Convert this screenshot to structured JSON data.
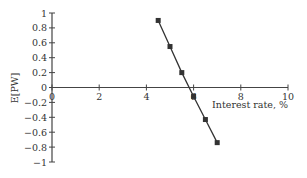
{
  "chart_data": {
    "type": "line",
    "title": "",
    "xlabel": "Interest rate, %",
    "ylabel": "E[PW]",
    "xlim": [
      0,
      10
    ],
    "ylim": [
      -1,
      1
    ],
    "x_ticks": [
      0,
      2,
      4,
      6,
      8,
      10
    ],
    "y_ticks": [
      1,
      0.8,
      0.6,
      0.4,
      0.2,
      0,
      -0.2,
      -0.4,
      -0.6,
      -0.8,
      -1
    ],
    "x_tick_labels": [
      "0",
      "2",
      "4",
      "6",
      "8",
      "10"
    ],
    "y_tick_labels": [
      "1",
      "0.8",
      "0.6",
      "0.4",
      "0.2",
      "0",
      "−0.2",
      "−0.4",
      "−0.6",
      "−0.8",
      "−1"
    ],
    "grid": false,
    "legend": null,
    "series": [
      {
        "name": "E[PW]",
        "marker": "square",
        "color": "#333333",
        "x": [
          4.5,
          5.0,
          5.5,
          6.0,
          6.5,
          7.0
        ],
        "y": [
          0.9,
          0.55,
          0.2,
          -0.12,
          -0.43,
          -0.74
        ]
      }
    ]
  },
  "colors": {
    "axis": "#444444",
    "line": "#333333",
    "marker": "#333333",
    "background": "#ffffff"
  }
}
